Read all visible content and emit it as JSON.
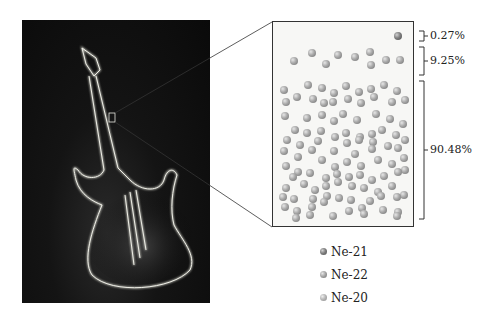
{
  "figure": {
    "photo": {
      "subject": "neon-guitar-sign",
      "background": "#0a0a0a",
      "glow": "#d8d8d0"
    },
    "zoom_box": {
      "x": 109,
      "y": 113,
      "w": 6,
      "h": 9
    }
  },
  "sample_box": {
    "ne21_atoms": [
      [
        398,
        36
      ]
    ],
    "ne22_atoms": [
      [
        294,
        61
      ],
      [
        312,
        53
      ],
      [
        326,
        64
      ],
      [
        338,
        55
      ],
      [
        355,
        57
      ],
      [
        370,
        52
      ],
      [
        371,
        65
      ],
      [
        386,
        60
      ],
      [
        400,
        60
      ]
    ],
    "ne20_atoms": [
      [
        284,
        90
      ],
      [
        308,
        85
      ],
      [
        322,
        88
      ],
      [
        334,
        93
      ],
      [
        346,
        86
      ],
      [
        359,
        92
      ],
      [
        371,
        89
      ],
      [
        384,
        85
      ],
      [
        397,
        91
      ],
      [
        286,
        102
      ],
      [
        297,
        97
      ],
      [
        313,
        99
      ],
      [
        324,
        103
      ],
      [
        333,
        102
      ],
      [
        348,
        99
      ],
      [
        361,
        103
      ],
      [
        374,
        97
      ],
      [
        392,
        102
      ],
      [
        405,
        100
      ],
      [
        285,
        116
      ],
      [
        307,
        118
      ],
      [
        322,
        115
      ],
      [
        334,
        121
      ],
      [
        343,
        114
      ],
      [
        357,
        120
      ],
      [
        376,
        114
      ],
      [
        390,
        119
      ],
      [
        403,
        124
      ],
      [
        295,
        130
      ],
      [
        307,
        133
      ],
      [
        321,
        131
      ],
      [
        335,
        137
      ],
      [
        346,
        133
      ],
      [
        360,
        137
      ],
      [
        372,
        134
      ],
      [
        382,
        130
      ],
      [
        396,
        135
      ],
      [
        287,
        140
      ],
      [
        300,
        145
      ],
      [
        318,
        141
      ],
      [
        347,
        143
      ],
      [
        359,
        140
      ],
      [
        373,
        142
      ],
      [
        388,
        146
      ],
      [
        405,
        140
      ],
      [
        284,
        151
      ],
      [
        298,
        157
      ],
      [
        312,
        150
      ],
      [
        334,
        151
      ],
      [
        355,
        154
      ],
      [
        372,
        149
      ],
      [
        398,
        148
      ],
      [
        404,
        158
      ],
      [
        286,
        166
      ],
      [
        298,
        172
      ],
      [
        322,
        160
      ],
      [
        335,
        167
      ],
      [
        347,
        162
      ],
      [
        361,
        166
      ],
      [
        378,
        160
      ],
      [
        392,
        164
      ],
      [
        405,
        170
      ],
      [
        293,
        177
      ],
      [
        310,
        173
      ],
      [
        326,
        178
      ],
      [
        337,
        174
      ],
      [
        349,
        177
      ],
      [
        360,
        175
      ],
      [
        372,
        180
      ],
      [
        384,
        176
      ],
      [
        398,
        172
      ],
      [
        286,
        188
      ],
      [
        304,
        184
      ],
      [
        315,
        190
      ],
      [
        326,
        186
      ],
      [
        338,
        182
      ],
      [
        352,
        186
      ],
      [
        364,
        188
      ],
      [
        378,
        192
      ],
      [
        392,
        186
      ],
      [
        404,
        195
      ],
      [
        283,
        197
      ],
      [
        294,
        199
      ],
      [
        313,
        199
      ],
      [
        327,
        196
      ],
      [
        339,
        198
      ],
      [
        351,
        200
      ],
      [
        370,
        201
      ],
      [
        381,
        196
      ],
      [
        397,
        197
      ],
      [
        285,
        207
      ],
      [
        297,
        211
      ],
      [
        312,
        207
      ],
      [
        324,
        202
      ],
      [
        349,
        211
      ],
      [
        362,
        208
      ],
      [
        383,
        210
      ],
      [
        398,
        212
      ],
      [
        296,
        218
      ],
      [
        310,
        215
      ],
      [
        333,
        216
      ],
      [
        364,
        214
      ],
      [
        397,
        216
      ]
    ]
  },
  "annotations": [
    {
      "label": "0.27%",
      "bracket_top": 31,
      "bracket_bottom": 41
    },
    {
      "label": "9.25%",
      "bracket_top": 47,
      "bracket_bottom": 75
    },
    {
      "label": "90.48%",
      "bracket_top": 81,
      "bracket_bottom": 219
    }
  ],
  "legend": [
    {
      "label": "Ne-21",
      "class": "ne21"
    },
    {
      "label": "Ne-22",
      "class": "ne22"
    },
    {
      "label": "Ne-20",
      "class": "ne20"
    }
  ]
}
